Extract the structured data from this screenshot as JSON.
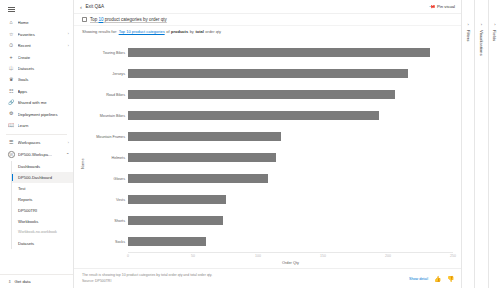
{
  "sidebar": {
    "hamburger_icon": "hamburger-icon",
    "items": [
      {
        "label": "Home",
        "icon": "home-icon",
        "chevron": "",
        "selected": false
      },
      {
        "label": "Favorites",
        "icon": "star-icon",
        "chevron": "›",
        "selected": false
      },
      {
        "label": "Recent",
        "icon": "clock-icon",
        "chevron": "›",
        "selected": false
      },
      {
        "label": "Create",
        "icon": "plus-icon",
        "chevron": "",
        "selected": false
      },
      {
        "label": "Datasets",
        "icon": "database-icon",
        "chevron": "",
        "selected": false
      },
      {
        "label": "Goals",
        "icon": "trophy-icon",
        "chevron": "",
        "selected": false
      },
      {
        "label": "Apps",
        "icon": "apps-icon",
        "chevron": "",
        "selected": false
      },
      {
        "label": "Shared with me",
        "icon": "share-icon",
        "chevron": "",
        "selected": false
      },
      {
        "label": "Deployment pipelines",
        "icon": "pipeline-icon",
        "chevron": "",
        "selected": false
      },
      {
        "label": "Learn",
        "icon": "book-icon",
        "chevron": "",
        "selected": false
      },
      {
        "label": "Workspaces",
        "icon": "workspaces-icon",
        "chevron": "›",
        "selected": false
      }
    ],
    "workspace": {
      "name": "DP500-Workspa…",
      "icon": "workspace-circle-icon",
      "badge": "W",
      "collapse_chevron": "⌃",
      "sub_items": [
        {
          "label": "Dashboards",
          "active": false,
          "muted": false
        },
        {
          "label": "DP500-Dashboard",
          "active": true,
          "muted": false
        },
        {
          "label": "Test",
          "active": false,
          "muted": false
        },
        {
          "label": "Reports",
          "active": false,
          "muted": false
        },
        {
          "label": "DP500TRI",
          "active": false,
          "muted": false
        },
        {
          "label": "Workbooks",
          "active": false,
          "muted": false
        },
        {
          "label": "Workbook-no-workbook",
          "active": false,
          "muted": true
        },
        {
          "label": "Datasets",
          "active": false,
          "muted": false
        }
      ]
    },
    "get_data": {
      "label": "Get data",
      "icon": "get-data-icon"
    }
  },
  "topbar": {
    "back_icon": "back-chevron-icon",
    "exit_label": "Exit Q&A",
    "pin_visual_label": "Pin visual",
    "pin_icon": "pin-icon"
  },
  "question": {
    "icon": "question-box-icon",
    "prefix": "Top ",
    "highlight": "10",
    "suffix": " product categories by order qty"
  },
  "showing": {
    "prefix": "Showing results for: ",
    "link_1": "Top 10 product categories",
    "mid_1": " of ",
    "bold_1": "products",
    "mid_2": " by ",
    "bold_2": "total",
    "tail": " order qty"
  },
  "chart_data": {
    "type": "bar",
    "orientation": "horizontal",
    "title": "",
    "xlabel": "Order Qty",
    "ylabel": "Name",
    "xlim": [
      0,
      250
    ],
    "xticks": [
      "0",
      "50",
      "100",
      "150",
      "200",
      "250"
    ],
    "grid": false,
    "legend": "none",
    "bar_color": "#7b7b7b",
    "categories": [
      "Touring Bikes",
      "Jerseys",
      "Road Bikes",
      "Mountain Bikes",
      "Mountain Frames",
      "Helmets",
      "Gloves",
      "Vests",
      "Shorts",
      "Socks"
    ],
    "values": [
      232,
      215,
      205,
      193,
      118,
      114,
      108,
      75,
      73,
      60
    ]
  },
  "footer": {
    "line_1": "The result is showing top 10 product categories by total order qty and total order qty.",
    "line_2": "Source: DP500TRI",
    "link": "Show detail",
    "thumbs_up_icon": "thumbs-up-icon",
    "thumbs_down_icon": "thumbs-down-icon"
  },
  "right_panes": [
    {
      "title": "Filters",
      "chevron": "›"
    },
    {
      "title": "Visualizations",
      "chevron": "›"
    },
    {
      "title": "Fields",
      "chevron": "›"
    }
  ]
}
